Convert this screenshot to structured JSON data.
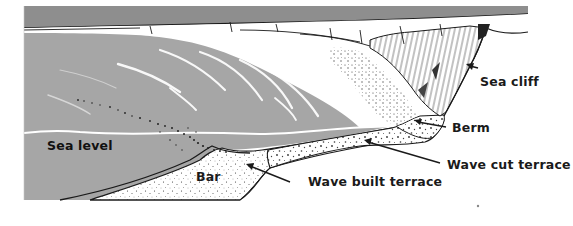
{
  "diagram": {
    "type": "coastal-profile-illustration",
    "colors": {
      "water": "#a6a6a6",
      "sky": "#8e8e8e",
      "sand": "#ffffff",
      "outline": "#1a1a1a",
      "sea_level_line": "#ffffff",
      "label_text": "#1a1a1a"
    },
    "labels": {
      "sea_cliff": "Sea cliff",
      "berm": "Berm",
      "sea_level": "Sea level",
      "wave_cut_terrace": "Wave cut terrace",
      "bar": "Bar",
      "wave_built_terrace": "Wave built terrace"
    }
  }
}
